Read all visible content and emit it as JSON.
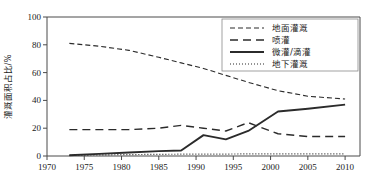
{
  "chart_data": {
    "type": "line",
    "title": "",
    "xlabel": "",
    "ylabel": "灌溉面积占比/%",
    "xlim": [
      1970,
      2012
    ],
    "ylim": [
      0,
      100
    ],
    "grid": false,
    "legend_position": "top-right",
    "xticks": [
      "1970",
      "1975",
      "1980",
      "1985",
      "1990",
      "1995",
      "2000",
      "2005",
      "2010"
    ],
    "xtick_values": [
      1970,
      1975,
      1980,
      1985,
      1990,
      1995,
      2000,
      2005,
      2010
    ],
    "yticks": [
      "0",
      "20",
      "40",
      "60",
      "80",
      "100"
    ],
    "ytick_values": [
      0,
      20,
      40,
      60,
      80,
      100
    ],
    "series": [
      {
        "name": "地面灌溉",
        "style": "dashed",
        "x": [
          1973,
          1977,
          1981,
          1985,
          1988,
          1991,
          1994,
          1997,
          2001,
          2005,
          2010
        ],
        "values": [
          81,
          79,
          76,
          71,
          67,
          63,
          58,
          53,
          47,
          43,
          41
        ]
      },
      {
        "name": "喷灌",
        "style": "long-dashed",
        "x": [
          1973,
          1977,
          1981,
          1985,
          1988,
          1991,
          1994,
          1997,
          2001,
          2005,
          2010
        ],
        "values": [
          19,
          19,
          19,
          20,
          22,
          20,
          18,
          24,
          16,
          14,
          14
        ]
      },
      {
        "name": "微灌/滴灌",
        "style": "solid",
        "x": [
          1973,
          1977,
          1981,
          1985,
          1988,
          1991,
          1994,
          1997,
          2001,
          2005,
          2010
        ],
        "values": [
          0.5,
          1.5,
          2.5,
          3.5,
          4,
          15,
          12,
          18,
          32,
          34,
          37
        ]
      },
      {
        "name": "地下灌溉",
        "style": "dotted",
        "x": [
          1973,
          1977,
          1981,
          1985,
          1988,
          1991,
          1994,
          1997,
          2001,
          2005,
          2010
        ],
        "values": [
          0.5,
          0.8,
          1,
          1.2,
          1.3,
          1.4,
          1.4,
          1.5,
          1.5,
          1.6,
          1.6
        ]
      }
    ]
  },
  "legend": {
    "items": [
      {
        "label": "地面灌溉",
        "style": "dashed"
      },
      {
        "label": "喷灌",
        "style": "long-dashed"
      },
      {
        "label": "微灌/滴灌",
        "style": "solid"
      },
      {
        "label": "地下灌溉",
        "style": "dotted"
      }
    ]
  },
  "axes": {
    "y_label": "灌溉面积占比/%"
  },
  "colors": {
    "line": "#2b2b2b",
    "axis": "#4a4a4a",
    "text": "#1a1a1a",
    "background": "#ffffff"
  }
}
